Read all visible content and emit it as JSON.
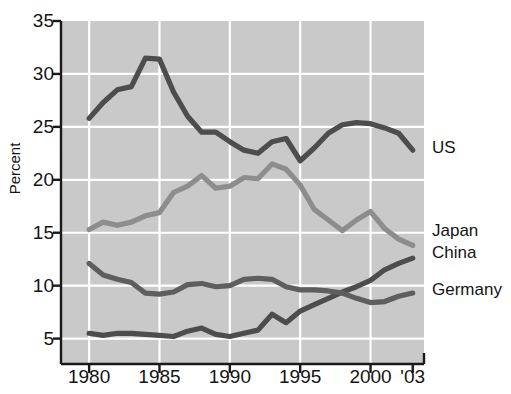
{
  "chart_data": {
    "type": "line",
    "title": "",
    "xlabel": "",
    "ylabel": "Percent",
    "xlim": [
      1978.0,
      2003.8
    ],
    "ylim": [
      2.6,
      35.0
    ],
    "grid": true,
    "legend_position": "right-inline",
    "y_ticks": [
      5,
      10,
      15,
      20,
      25,
      30,
      35
    ],
    "y_tick_labels": [
      "5",
      "10",
      "15",
      "20",
      "25",
      "30",
      "35"
    ],
    "x_ticks": [
      1980,
      1985,
      1990,
      1995,
      2000,
      2003
    ],
    "x_tick_labels": [
      "1980",
      "1985",
      "1990",
      "1995",
      "2000",
      "'03"
    ],
    "x": [
      1980,
      1981,
      1982,
      1983,
      1984,
      1985,
      1986,
      1987,
      1988,
      1989,
      1990,
      1991,
      1992,
      1993,
      1994,
      1995,
      1996,
      1997,
      1998,
      1999,
      2000,
      2001,
      2002,
      2003
    ],
    "series": [
      {
        "name": "US",
        "color": "#4d4d4d",
        "values": [
          25.8,
          27.3,
          28.5,
          28.8,
          31.5,
          31.4,
          28.3,
          26.0,
          24.5,
          24.5,
          23.6,
          22.8,
          22.5,
          23.6,
          23.9,
          21.8,
          23.0,
          24.4,
          25.2,
          25.4,
          25.3,
          24.9,
          24.4,
          22.8
        ]
      },
      {
        "name": "Japan",
        "color": "#8d8d8d",
        "values": [
          15.3,
          16.0,
          15.7,
          16.0,
          16.6,
          16.9,
          18.8,
          19.4,
          20.4,
          19.2,
          19.4,
          20.2,
          20.1,
          21.5,
          21.0,
          19.5,
          17.2,
          16.2,
          15.2,
          16.2,
          17.0,
          15.4,
          14.4,
          13.8
        ]
      },
      {
        "name": "China",
        "color": "#4d4d4d",
        "values": [
          5.5,
          5.3,
          5.5,
          5.5,
          5.4,
          5.3,
          5.2,
          5.7,
          6.0,
          5.4,
          5.2,
          5.5,
          5.8,
          7.3,
          6.5,
          7.6,
          8.2,
          8.8,
          9.4,
          9.9,
          10.5,
          11.5,
          12.1,
          12.6
        ]
      },
      {
        "name": "Germany",
        "color": "#5e5e5e",
        "values": [
          12.1,
          11.0,
          10.6,
          10.3,
          9.3,
          9.2,
          9.4,
          10.1,
          10.2,
          9.9,
          10.0,
          10.6,
          10.7,
          10.6,
          9.9,
          9.6,
          9.6,
          9.5,
          9.3,
          8.8,
          8.4,
          8.5,
          9.0,
          9.3
        ]
      }
    ],
    "series_label_anchors": [
      {
        "name": "US",
        "value": 22.8
      },
      {
        "name": "Japan",
        "value": 15.0
      },
      {
        "name": "China",
        "value": 12.9
      },
      {
        "name": "Germany",
        "value": 9.4
      }
    ],
    "plot_background": "#c9c9c9",
    "grid_color": "#ffffff",
    "axis_color": "#1a1a1a"
  }
}
